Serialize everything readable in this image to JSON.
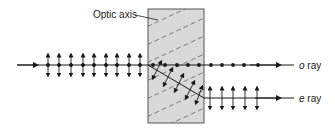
{
  "figure": {
    "type": "birefringence-diagram",
    "labels": {
      "optic_axis": "Optic axis",
      "o_ray_symbol": "o",
      "o_ray_word": " ray",
      "e_ray_symbol": "e",
      "e_ray_word": " ray"
    },
    "colors": {
      "crystal_fill": "#d9d9d9",
      "crystal_stroke": "#555555",
      "line": "#1a1a1a",
      "hatch": "#666666"
    }
  }
}
